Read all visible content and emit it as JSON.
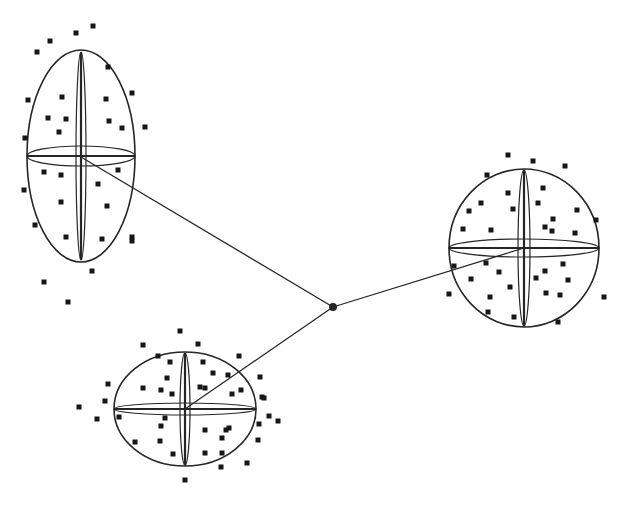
{
  "figure": {
    "width": 629,
    "height": 508,
    "background_color": "#ffffff",
    "line_color": "#262626",
    "point_color": "#171717",
    "point_size": 5,
    "boundary_stroke_width": 1.6,
    "lens_stroke_width": 1.2,
    "axis_stroke_width": 2.2,
    "connector_stroke_width": 1.3,
    "hub": {
      "x": 333,
      "y": 307,
      "radius": 4
    },
    "connectors": [
      {
        "x1": 333,
        "y1": 307,
        "x2": 81,
        "y2": 157
      },
      {
        "x1": 333,
        "y1": 307,
        "x2": 524,
        "y2": 248
      },
      {
        "x1": 333,
        "y1": 307,
        "x2": 185,
        "y2": 409
      }
    ],
    "clusters": [
      {
        "name": "top-left",
        "cx": 81,
        "cy": 156,
        "rx": 54,
        "ry": 106,
        "v_rx": 5,
        "v_ry": 104,
        "h_rx": 54,
        "h_ry": 10,
        "points": [
          [
            93,
            26
          ],
          [
            76,
            33
          ],
          [
            50,
            41
          ],
          [
            37,
            52
          ],
          [
            108,
            67
          ],
          [
            62,
            97
          ],
          [
            132,
            93
          ],
          [
            106,
            99
          ],
          [
            28,
            100
          ],
          [
            48,
            118
          ],
          [
            66,
            119
          ],
          [
            109,
            121
          ],
          [
            145,
            127
          ],
          [
            122,
            128
          ],
          [
            59,
            132
          ],
          [
            25,
            138
          ],
          [
            118,
            170
          ],
          [
            44,
            172
          ],
          [
            61,
            175
          ],
          [
            98,
            184
          ],
          [
            24,
            190
          ],
          [
            61,
            202
          ],
          [
            107,
            206
          ],
          [
            35,
            225
          ],
          [
            66,
            237
          ],
          [
            102,
            239
          ],
          [
            132,
            237
          ],
          [
            132,
            241
          ],
          [
            92,
            271
          ],
          [
            44,
            282
          ],
          [
            68,
            302
          ]
        ]
      },
      {
        "name": "bottom-center",
        "cx": 185,
        "cy": 409,
        "rx": 71,
        "ry": 57,
        "v_rx": 5,
        "v_ry": 56,
        "h_rx": 71,
        "h_ry": 6,
        "points": [
          [
            180,
            331
          ],
          [
            143,
            345
          ],
          [
            198,
            344
          ],
          [
            239,
            356
          ],
          [
            158,
            356
          ],
          [
            170,
            362
          ],
          [
            203,
            362
          ],
          [
            213,
            373
          ],
          [
            228,
            375
          ],
          [
            260,
            377
          ],
          [
            167,
            378
          ],
          [
            108,
            384
          ],
          [
            143,
            388
          ],
          [
            161,
            390
          ],
          [
            205,
            388
          ],
          [
            200,
            387
          ],
          [
            172,
            394
          ],
          [
            232,
            394
          ],
          [
            241,
            390
          ],
          [
            262,
            397
          ],
          [
            105,
            401
          ],
          [
            79,
            407
          ],
          [
            264,
            398
          ],
          [
            119,
            417
          ],
          [
            97,
            419
          ],
          [
            165,
            418
          ],
          [
            161,
            426
          ],
          [
            226,
            430
          ],
          [
            205,
            430
          ],
          [
            229,
            428
          ],
          [
            259,
            424
          ],
          [
            269,
            416
          ],
          [
            278,
            421
          ],
          [
            160,
            441
          ],
          [
            135,
            442
          ],
          [
            222,
            438
          ],
          [
            258,
            440
          ],
          [
            173,
            454
          ],
          [
            205,
            453
          ],
          [
            222,
            453
          ],
          [
            247,
            463
          ],
          [
            221,
            467
          ],
          [
            185,
            480
          ]
        ]
      },
      {
        "name": "right",
        "cx": 524,
        "cy": 248,
        "rx": 75,
        "ry": 79,
        "v_rx": 6,
        "v_ry": 78,
        "h_rx": 75,
        "h_ry": 9,
        "points": [
          [
            508,
            155
          ],
          [
            533,
            161
          ],
          [
            565,
            166
          ],
          [
            487,
            175
          ],
          [
            508,
            193
          ],
          [
            543,
            188
          ],
          [
            481,
            203
          ],
          [
            513,
            209
          ],
          [
            538,
            203
          ],
          [
            469,
            211
          ],
          [
            577,
            210
          ],
          [
            553,
            219
          ],
          [
            463,
            229
          ],
          [
            491,
            230
          ],
          [
            545,
            227
          ],
          [
            552,
            231
          ],
          [
            575,
            233
          ],
          [
            596,
            220
          ],
          [
            454,
            266
          ],
          [
            486,
            263
          ],
          [
            499,
            272
          ],
          [
            471,
            279
          ],
          [
            545,
            271
          ],
          [
            563,
            264
          ],
          [
            536,
            278
          ],
          [
            568,
            280
          ],
          [
            510,
            287
          ],
          [
            546,
            293
          ],
          [
            449,
            294
          ],
          [
            490,
            297
          ],
          [
            560,
            295
          ],
          [
            604,
            297
          ],
          [
            488,
            312
          ],
          [
            514,
            317
          ],
          [
            558,
            322
          ]
        ]
      }
    ]
  }
}
